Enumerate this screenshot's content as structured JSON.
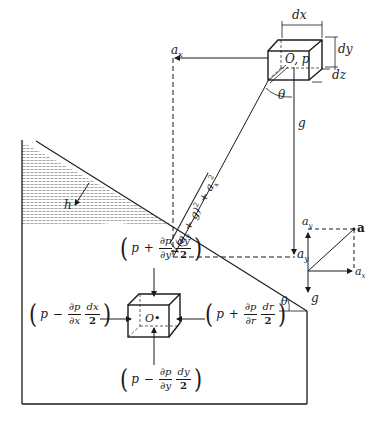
{
  "figure": {
    "upper": {
      "labels": {
        "dx": "dx",
        "dy": "dy",
        "dz": "dz",
        "origin": "O, p",
        "ax": "a",
        "ax_sub": "x",
        "ay": "a",
        "ay_sub": "y",
        "g": "g",
        "theta": "θ",
        "resultant": "√((a_y + g)² + a_x²)",
        "resultant_root": "√",
        "resultant_body": "(a",
        "resultant_body_sub": "y",
        "resultant_body_rest": " + g)",
        "resultant_sq1": "2",
        "resultant_plus": " + a",
        "resultant_sub2": "x",
        "resultant_sq2": "2"
      }
    },
    "tank": {
      "labels": {
        "h": "h",
        "theta": "θ",
        "origin": "O•"
      },
      "shading_color": "#c8c8c8",
      "line_color": "#1a1a1a"
    },
    "forces": {
      "top": {
        "paren_l": "(",
        "p": "p",
        "op": "+",
        "d_num": "∂p",
        "d_den": "∂y",
        "f_num": "dy",
        "f_den": "2",
        "paren_r": ")"
      },
      "bottom": {
        "paren_l": "(",
        "p": "p",
        "op": "−",
        "d_num": "∂p",
        "d_den": "∂y",
        "f_num": "dy",
        "f_den": "2",
        "paren_r": ")"
      },
      "left": {
        "paren_l": "(",
        "p": "p",
        "op": "−",
        "d_num": "∂p",
        "d_den": "∂x",
        "f_num": "dx",
        "f_den": "2",
        "paren_r": ")"
      },
      "right": {
        "paren_l": "(",
        "p": "p",
        "op": "+",
        "d_num": "∂p",
        "d_den": "∂r",
        "f_num": "dr",
        "f_den": "2",
        "paren_r": ")"
      }
    },
    "vector_inset": {
      "labels": {
        "ay": "a",
        "ay_sub": "y",
        "a": "a",
        "ax": "a",
        "ax_sub": "x",
        "g": "g"
      }
    }
  }
}
